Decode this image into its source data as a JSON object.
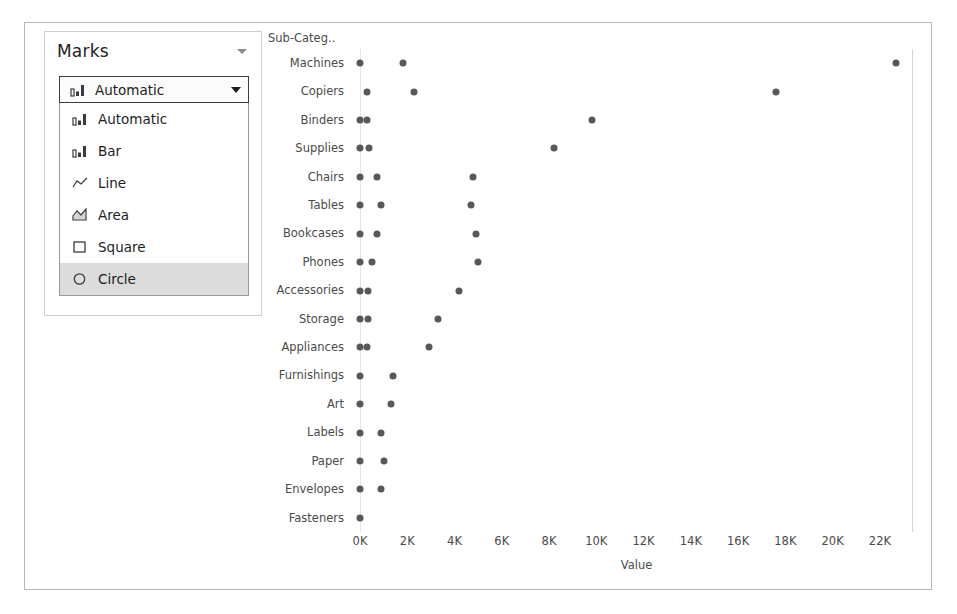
{
  "marks_card": {
    "title": "Marks",
    "header_caret_icon": "chevron-down-icon",
    "combo": {
      "value": "Automatic",
      "icon": "bar-mark-icon",
      "arrow_icon": "caret-down-icon"
    },
    "menu_items": [
      {
        "label": "Automatic",
        "icon": "bar-mark-icon",
        "selected": false
      },
      {
        "label": "Bar",
        "icon": "bar-mark-icon",
        "selected": false
      },
      {
        "label": "Line",
        "icon": "line-mark-icon",
        "selected": false
      },
      {
        "label": "Area",
        "icon": "area-mark-icon",
        "selected": false
      },
      {
        "label": "Square",
        "icon": "square-mark-icon",
        "selected": false
      },
      {
        "label": "Circle",
        "icon": "circle-mark-icon",
        "selected": true
      }
    ],
    "selected_color": "#dcdcdc"
  },
  "chart_data": {
    "type": "scatter",
    "title": "",
    "corner_label": "Sub-Categ..",
    "xlabel": "Value",
    "ylabel": "",
    "xlim": [
      0,
      23400
    ],
    "xticks": [
      0,
      2000,
      4000,
      6000,
      8000,
      10000,
      12000,
      14000,
      16000,
      18000,
      20000,
      22000
    ],
    "xticklabels": [
      "0K",
      "2K",
      "4K",
      "6K",
      "8K",
      "10K",
      "12K",
      "14K",
      "16K",
      "18K",
      "20K",
      "22K"
    ],
    "grid": false,
    "legend": "none",
    "mark_color": "#57585b",
    "categories": [
      "Machines",
      "Copiers",
      "Binders",
      "Supplies",
      "Chairs",
      "Tables",
      "Bookcases",
      "Phones",
      "Accessories",
      "Storage",
      "Appliances",
      "Furnishings",
      "Art",
      "Labels",
      "Paper",
      "Envelopes",
      "Fasteners"
    ],
    "points": [
      {
        "category": "Machines",
        "values": [
          0,
          1800,
          22700
        ]
      },
      {
        "category": "Copiers",
        "values": [
          300,
          2300,
          17600
        ]
      },
      {
        "category": "Binders",
        "values": [
          0,
          300,
          9800
        ]
      },
      {
        "category": "Supplies",
        "values": [
          0,
          400,
          8200
        ]
      },
      {
        "category": "Chairs",
        "values": [
          0,
          700,
          4800
        ]
      },
      {
        "category": "Tables",
        "values": [
          0,
          900,
          4700
        ]
      },
      {
        "category": "Bookcases",
        "values": [
          0,
          700,
          4900
        ]
      },
      {
        "category": "Phones",
        "values": [
          0,
          500,
          5000
        ]
      },
      {
        "category": "Accessories",
        "values": [
          0,
          350,
          4200
        ]
      },
      {
        "category": "Storage",
        "values": [
          0,
          350,
          3300
        ]
      },
      {
        "category": "Appliances",
        "values": [
          0,
          300,
          2900
        ]
      },
      {
        "category": "Furnishings",
        "values": [
          0,
          1400
        ]
      },
      {
        "category": "Art",
        "values": [
          0,
          1300
        ]
      },
      {
        "category": "Labels",
        "values": [
          0,
          900
        ]
      },
      {
        "category": "Paper",
        "values": [
          0,
          1000
        ]
      },
      {
        "category": "Envelopes",
        "values": [
          0,
          900
        ]
      },
      {
        "category": "Fasteners",
        "values": [
          0
        ]
      }
    ]
  }
}
